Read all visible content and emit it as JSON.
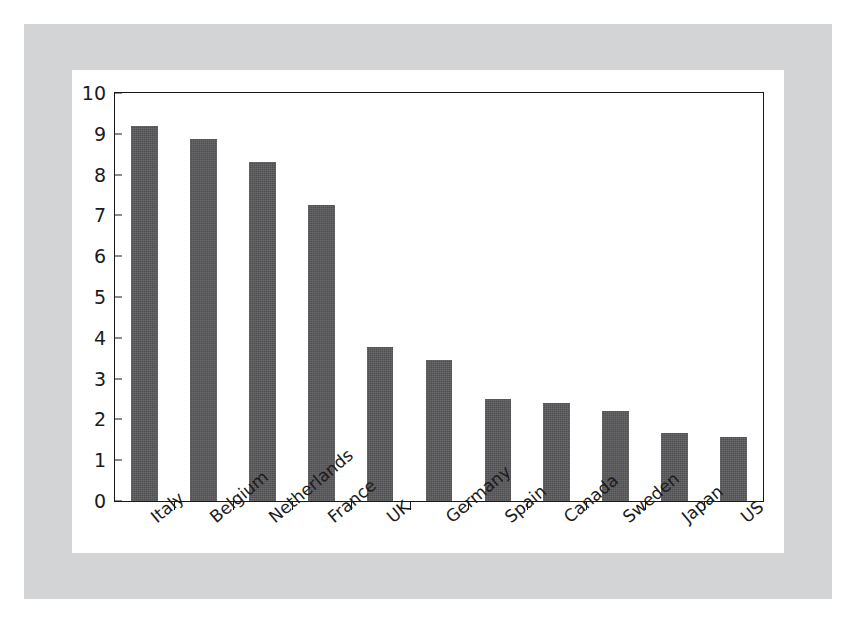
{
  "figure": {
    "background_color": "#ffffff",
    "mat_color": "#d3d4d6",
    "card_color": "#ffffff",
    "frame_color": "#18181a",
    "bar_color": "#58585a"
  },
  "chart_data": {
    "type": "bar",
    "title": "",
    "subtitle": "",
    "xlabel": "",
    "ylabel": "",
    "ylim": [
      0,
      10
    ],
    "yticks": [
      0,
      1,
      2,
      3,
      4,
      5,
      6,
      7,
      8,
      9,
      10
    ],
    "ytick_labels": [
      "0",
      "1",
      "2",
      "3",
      "4",
      "5",
      "6",
      "7",
      "8",
      "9",
      "10"
    ],
    "grid": false,
    "legend": false,
    "legend_position": "none",
    "categories": [
      "Italy",
      "Belgium",
      "Netherlands",
      "France",
      "UK",
      "Germany",
      "Spain",
      "Canada",
      "Sweden",
      "Japan",
      "US"
    ],
    "values": [
      9.2,
      8.87,
      8.3,
      7.25,
      3.78,
      3.45,
      2.5,
      2.4,
      2.2,
      1.67,
      1.58
    ],
    "series": [
      {
        "name": "",
        "values": [
          9.2,
          8.87,
          8.3,
          7.25,
          3.78,
          3.45,
          2.5,
          2.4,
          2.2,
          1.67,
          1.58
        ]
      }
    ],
    "annotations": []
  }
}
